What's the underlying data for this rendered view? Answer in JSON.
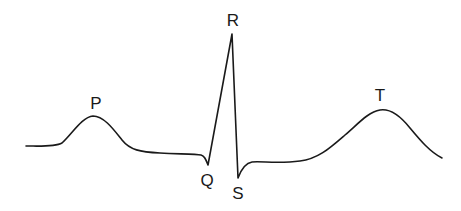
{
  "diagram": {
    "labels": {
      "p": "P",
      "q": "Q",
      "r": "R",
      "s": "S",
      "t": "T"
    },
    "colors": {
      "line": "#1a1a1a",
      "background": "#ffffff"
    }
  }
}
